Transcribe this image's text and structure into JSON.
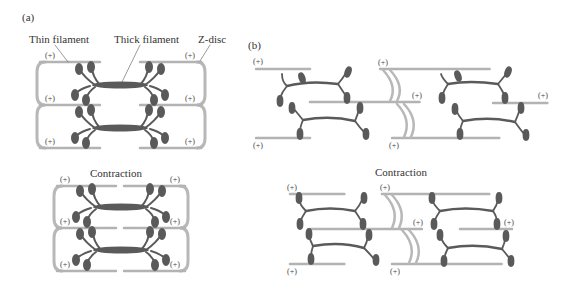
{
  "panels": {
    "a": {
      "label": "(a)",
      "labels": {
        "thin_filament": "Thin filament",
        "thick_filament": "Thick filament",
        "z_disc": "Z-disc"
      },
      "contraction_label": "Contraction"
    },
    "b": {
      "label": "(b)",
      "contraction_label": "Contraction"
    }
  },
  "polarity_mark": "(+)",
  "colors": {
    "thin_filament": "#b3b3b3",
    "z_disc": "#b8b8b8",
    "myosin": "#5a5a5a",
    "text": "#333333"
  }
}
